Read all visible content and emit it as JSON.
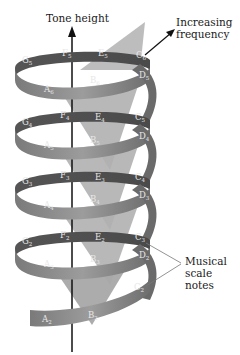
{
  "diagram": {
    "type": "pitch-helix",
    "axis_label": "Tone height",
    "arrow_label_line1": "Increasing",
    "arrow_label_line2": "frequency",
    "callout_label_line1": "Musical",
    "callout_label_line2": "scale",
    "callout_label_line3": "notes",
    "colors": {
      "ribbon_front": "#8a8a8a",
      "ribbon_back": "#5e5e5e",
      "cone": "#b5b5b5",
      "cone_dark": "#9a9a9a",
      "axis": "#111111",
      "background": "#ffffff"
    },
    "turns": [
      {
        "octave": 5,
        "notes": [
          {
            "n": "G",
            "s": "5",
            "x": 22,
            "y": 63
          },
          {
            "n": "F",
            "s": "5",
            "x": 62,
            "y": 56
          },
          {
            "n": "E",
            "s": "5",
            "x": 98,
            "y": 56
          },
          {
            "n": "C",
            "s": "6",
            "x": 136,
            "y": 58
          },
          {
            "n": "D",
            "s": "5",
            "x": 139,
            "y": 78
          },
          {
            "n": "B",
            "s": "6",
            "x": 90,
            "y": 83
          },
          {
            "n": "A",
            "s": "6",
            "x": 44,
            "y": 92
          }
        ]
      },
      {
        "octave": 4,
        "notes": [
          {
            "n": "G",
            "s": "4",
            "x": 22,
            "y": 125
          },
          {
            "n": "F",
            "s": "4",
            "x": 60,
            "y": 118
          },
          {
            "n": "E",
            "s": "4",
            "x": 95,
            "y": 120
          },
          {
            "n": "C",
            "s": "5",
            "x": 135,
            "y": 120
          },
          {
            "n": "D",
            "s": "4",
            "x": 139,
            "y": 139
          },
          {
            "n": "B",
            "s": "5",
            "x": 90,
            "y": 143
          },
          {
            "n": "A",
            "s": "5",
            "x": 44,
            "y": 148
          }
        ]
      },
      {
        "octave": 3,
        "notes": [
          {
            "n": "G",
            "s": "3",
            "x": 22,
            "y": 184
          },
          {
            "n": "F",
            "s": "3",
            "x": 60,
            "y": 178
          },
          {
            "n": "E",
            "s": "3",
            "x": 95,
            "y": 180
          },
          {
            "n": "C",
            "s": "4",
            "x": 135,
            "y": 180
          },
          {
            "n": "D",
            "s": "3",
            "x": 139,
            "y": 198
          },
          {
            "n": "B",
            "s": "4",
            "x": 90,
            "y": 202
          },
          {
            "n": "A",
            "s": "4",
            "x": 44,
            "y": 208
          }
        ]
      },
      {
        "octave": 2,
        "notes": [
          {
            "n": "G",
            "s": "2",
            "x": 22,
            "y": 244
          },
          {
            "n": "F",
            "s": "2",
            "x": 60,
            "y": 238
          },
          {
            "n": "E",
            "s": "2",
            "x": 95,
            "y": 240
          },
          {
            "n": "C",
            "s": "3",
            "x": 135,
            "y": 240
          },
          {
            "n": "D",
            "s": "2",
            "x": 139,
            "y": 258
          },
          {
            "n": "B",
            "s": "3",
            "x": 90,
            "y": 262
          },
          {
            "n": "A",
            "s": "3",
            "x": 44,
            "y": 267
          }
        ]
      },
      {
        "octave": 1,
        "notes": [
          {
            "n": "C",
            "s": "2",
            "x": 134,
            "y": 290
          },
          {
            "n": "B",
            "s": "2",
            "x": 88,
            "y": 318
          },
          {
            "n": "A",
            "s": "2",
            "x": 42,
            "y": 322
          }
        ]
      }
    ]
  }
}
